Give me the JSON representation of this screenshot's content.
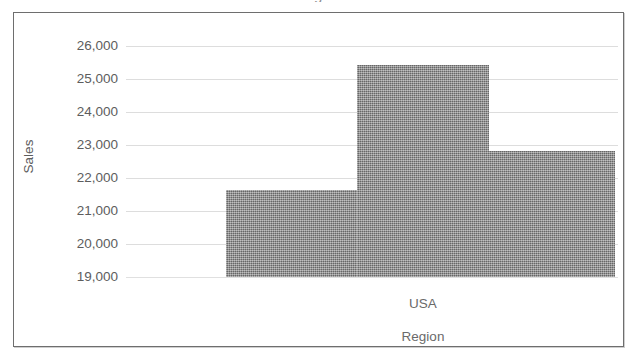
{
  "figure": {
    "truncated_top_glyph": "g",
    "frame_border_color": "#6e6e6e",
    "background_color": "#ffffff"
  },
  "chart_data": {
    "type": "bar",
    "title": "",
    "xlabel": "Region",
    "ylabel": "Sales",
    "categories": [
      "",
      "USA",
      ""
    ],
    "visible_category_labels": [
      "USA"
    ],
    "values": [
      21640,
      25430,
      22820
    ],
    "ylim": [
      19000,
      26000
    ],
    "ytick_labels": [
      "26,000",
      "25,000",
      "24,000",
      "23,000",
      "22,000",
      "21,000",
      "20,000",
      "19,000"
    ],
    "ytick_values": [
      26000,
      25000,
      24000,
      23000,
      22000,
      21000,
      20000,
      19000
    ],
    "grid": true,
    "grid_axis": "y",
    "grid_color": "#dddddd",
    "legend": null,
    "legend_position": "none",
    "bar_color": "#838383",
    "bar_gap": 0,
    "series": [
      {
        "name": "Sales",
        "values": [
          21640,
          25430,
          22820
        ]
      }
    ]
  }
}
